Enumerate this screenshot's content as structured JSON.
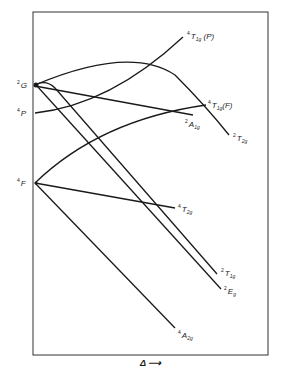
{
  "diagram": {
    "type": "energy-level correlation diagram",
    "x_axis_label": "Δ ⟶",
    "free_ion_terms": [
      {
        "sup": "2",
        "term": "G"
      },
      {
        "sup": "4",
        "term": "P"
      },
      {
        "sup": "4",
        "term": "F"
      }
    ],
    "states": [
      {
        "sup": "4",
        "term": "T",
        "sub": "1g",
        "suffix": "(P)"
      },
      {
        "sup": "4",
        "term": "T",
        "sub": "1g",
        "suffix": "(F)"
      },
      {
        "sup": "2",
        "term": "A",
        "sub": "1g",
        "suffix": ""
      },
      {
        "sup": "2",
        "term": "T",
        "sub": "2g",
        "suffix": ""
      },
      {
        "sup": "4",
        "term": "T",
        "sub": "2g",
        "suffix": ""
      },
      {
        "sup": "2",
        "term": "T",
        "sub": "1g",
        "suffix": ""
      },
      {
        "sup": "2",
        "term": "E",
        "sub": "g",
        "suffix": ""
      },
      {
        "sup": "4",
        "term": "A",
        "sub": "2g",
        "suffix": ""
      }
    ],
    "line_color": "#1a1a1a"
  }
}
